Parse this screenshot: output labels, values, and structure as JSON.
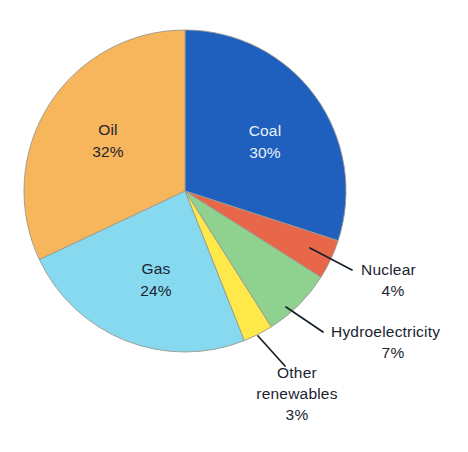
{
  "chart_data": {
    "type": "pie",
    "title": "",
    "subtitle": "",
    "xlabel": "",
    "ylabel": "",
    "legend_position": "none",
    "grid": false,
    "units": "percent",
    "total": 100,
    "start_angle_deg": 0,
    "direction": "clockwise",
    "categories": [
      "Coal",
      "Nuclear",
      "Hydroelectricity",
      "Other renewables",
      "Gas",
      "Oil"
    ],
    "values": [
      30,
      4,
      7,
      3,
      24,
      32
    ],
    "slices": [
      {
        "name": "Coal",
        "label": "Coal",
        "value": 30,
        "value_text": "30%",
        "color": "#1f5fbe",
        "label_placement": "inside",
        "label_style": "light",
        "label_x": 265,
        "label_y": 136,
        "start_deg": 0,
        "end_deg": 108
      },
      {
        "name": "Nuclear",
        "label": "Nuclear",
        "value": 4,
        "value_text": "4%",
        "color": "#e8674a",
        "label_placement": "callout",
        "label_style": "dark",
        "label_x": 361,
        "label_y": 275,
        "value_x": 383,
        "value_y": 296,
        "leader": [
          [
            310,
            248
          ],
          [
            352,
            270
          ]
        ]
      },
      {
        "name": "Hydroelectricity",
        "label": "Hydroelectricity",
        "value": 7,
        "value_text": "7%",
        "color": "#8fd18f",
        "label_placement": "callout",
        "label_style": "dark",
        "label_x": 331,
        "label_y": 337,
        "value_x": 383,
        "value_y": 358,
        "leader": [
          [
            286,
            307
          ],
          [
            323,
            332
          ]
        ]
      },
      {
        "name": "Other renewables",
        "label": "Other",
        "label_line2": "renewables",
        "value": 3,
        "value_text": "3%",
        "color": "#ffe84a",
        "label_placement": "callout",
        "label_style": "dark",
        "label_x": 297,
        "label_y": 378,
        "label2_x": 297,
        "label2_y": 398,
        "value_x": 297,
        "value_y": 419,
        "leader": [
          [
            258,
            336
          ],
          [
            285,
            366
          ]
        ]
      },
      {
        "name": "Gas",
        "label": "Gas",
        "value": 24,
        "value_text": "24%",
        "color": "#87d9f0",
        "label_placement": "inside",
        "label_style": "dark",
        "label_x": 156,
        "label_y": 274,
        "start_deg": 158.4,
        "end_deg": 244.8
      },
      {
        "name": "Oil",
        "label": "Oil",
        "value": 32,
        "value_text": "32%",
        "color": "#f7b55c",
        "label_placement": "inside",
        "label_style": "dark",
        "label_x": 108,
        "label_y": 135,
        "start_deg": 244.8,
        "end_deg": 360
      }
    ],
    "geometry": {
      "center_x": 185,
      "center_y": 191,
      "radius": 161
    }
  }
}
